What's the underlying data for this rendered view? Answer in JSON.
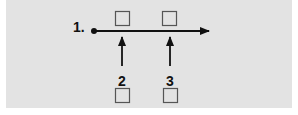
{
  "diagram": {
    "background_color": "#e3e3e3",
    "line_color": "#111111",
    "box_color": "#555555",
    "main_label": "1.",
    "arrow_labels": [
      "2",
      "3"
    ],
    "top_boxes": [
      {
        "id": "top-box-1",
        "checked": false
      },
      {
        "id": "top-box-2",
        "checked": false
      }
    ],
    "bottom_boxes": [
      {
        "id": "bottom-box-1",
        "checked": false
      },
      {
        "id": "bottom-box-2",
        "checked": false
      }
    ]
  }
}
